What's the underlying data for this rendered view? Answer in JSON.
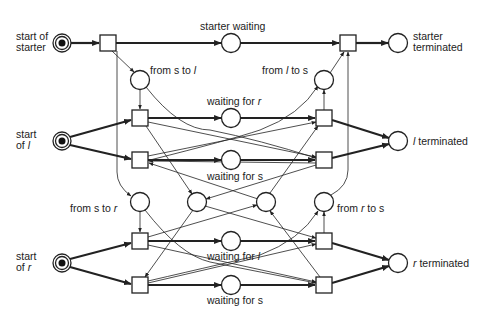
{
  "diagram": {
    "type": "petri-net",
    "places": [
      {
        "id": "start_starter",
        "label": [
          "start of",
          "starter"
        ],
        "x": 62,
        "y": 43,
        "token": true
      },
      {
        "id": "starter_waiting",
        "label": [
          "starter waiting"
        ],
        "x": 231,
        "y": 43
      },
      {
        "id": "starter_terminated",
        "label": [
          "starter",
          "terminated"
        ],
        "x": 398,
        "y": 43
      },
      {
        "id": "from_s_to_l",
        "label": [
          "from s to ",
          "l"
        ],
        "x": 140,
        "y": 80
      },
      {
        "id": "from_l_to_s",
        "label": [
          "from ",
          "l",
          " to s"
        ],
        "x": 324,
        "y": 80
      },
      {
        "id": "start_l",
        "label": [
          "start",
          "of ",
          "l"
        ],
        "x": 62,
        "y": 141,
        "token": true
      },
      {
        "id": "waiting_for_r",
        "label": [
          "waiting for ",
          "r"
        ],
        "x": 231,
        "y": 118
      },
      {
        "id": "waiting_for_s_l",
        "label": [
          "waiting for s"
        ],
        "x": 231,
        "y": 160
      },
      {
        "id": "l_terminated",
        "label": [
          "l",
          " terminated"
        ],
        "x": 398,
        "y": 141
      },
      {
        "id": "from_s_to_r",
        "label": [
          "from s to ",
          "r"
        ],
        "x": 140,
        "y": 202
      },
      {
        "id": "inner_left",
        "label": [],
        "x": 197,
        "y": 202
      },
      {
        "id": "inner_right",
        "label": [],
        "x": 266,
        "y": 202
      },
      {
        "id": "from_r_to_s",
        "label": [
          "from ",
          "r",
          " to s"
        ],
        "x": 324,
        "y": 202
      },
      {
        "id": "start_r",
        "label": [
          "start",
          "of ",
          "r"
        ],
        "x": 62,
        "y": 263,
        "token": true
      },
      {
        "id": "waiting_for_l",
        "label": [
          "waiting for ",
          "l"
        ],
        "x": 231,
        "y": 241
      },
      {
        "id": "waiting_for_s_r",
        "label": [
          "waiting for s"
        ],
        "x": 231,
        "y": 285
      },
      {
        "id": "r_terminated",
        "label": [
          "r",
          " terminated"
        ],
        "x": 398,
        "y": 263
      }
    ],
    "transitions": [
      {
        "id": "t_start_starter",
        "x": 108,
        "y": 43
      },
      {
        "id": "t_end_starter",
        "x": 348,
        "y": 43
      },
      {
        "id": "t_l1_left",
        "x": 140,
        "y": 118
      },
      {
        "id": "t_l2_left",
        "x": 140,
        "y": 160
      },
      {
        "id": "t_l1_right",
        "x": 324,
        "y": 118
      },
      {
        "id": "t_l2_right",
        "x": 324,
        "y": 160
      },
      {
        "id": "t_r1_left",
        "x": 140,
        "y": 241
      },
      {
        "id": "t_r2_left",
        "x": 140,
        "y": 285
      },
      {
        "id": "t_r1_right",
        "x": 324,
        "y": 241
      },
      {
        "id": "t_r2_right",
        "x": 324,
        "y": 285
      }
    ],
    "labels": {
      "start_of_starter_1": "start of",
      "start_of_starter_2": "starter",
      "starter_waiting": "starter waiting",
      "starter_terminated_1": "starter",
      "starter_terminated_2": "terminated",
      "from_s_to_l_a": "from s to ",
      "from_s_to_l_b": "l",
      "from_l_to_s_a": "from ",
      "from_l_to_s_b": "l",
      "from_l_to_s_c": " to s",
      "start_l_1": "start",
      "start_l_2a": "of ",
      "start_l_2b": "l",
      "waiting_for_r_a": "waiting for ",
      "waiting_for_r_b": "r",
      "waiting_for_s_top": "waiting for s",
      "l_terminated_a": "l",
      "l_terminated_b": " terminated",
      "from_s_to_r_a": "from s to ",
      "from_s_to_r_b": "r",
      "from_r_to_s_a": "from ",
      "from_r_to_s_b": "r",
      "from_r_to_s_c": " to s",
      "start_r_1": "start",
      "start_r_2a": "of ",
      "start_r_2b": "r",
      "waiting_for_l_a": "waiting for ",
      "waiting_for_l_b": "l",
      "waiting_for_s_bottom": "waiting for s",
      "r_terminated_a": "r",
      "r_terminated_b": " terminated"
    }
  }
}
